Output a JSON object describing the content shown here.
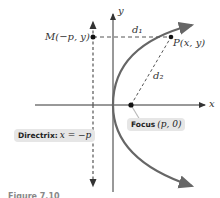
{
  "diagram": {
    "axes": {
      "x_label": "x",
      "y_label": "y"
    },
    "points": {
      "M": {
        "label": "M(−p, y)"
      },
      "P": {
        "label": "P(x, y)"
      },
      "focus": {
        "prefix": "Focus",
        "math": "(p, 0)"
      }
    },
    "distances": {
      "d1": {
        "label": "d₁"
      },
      "d2": {
        "label": "d₂"
      }
    },
    "directrix": {
      "prefix": "Directrix:",
      "math": "x = −p"
    },
    "caption": "Figure 7.10",
    "colors": {
      "axis": "#333333",
      "curve": "#666666",
      "dash": "#555555",
      "callout_bg": "#e6e6e6",
      "point": "#111111"
    }
  }
}
